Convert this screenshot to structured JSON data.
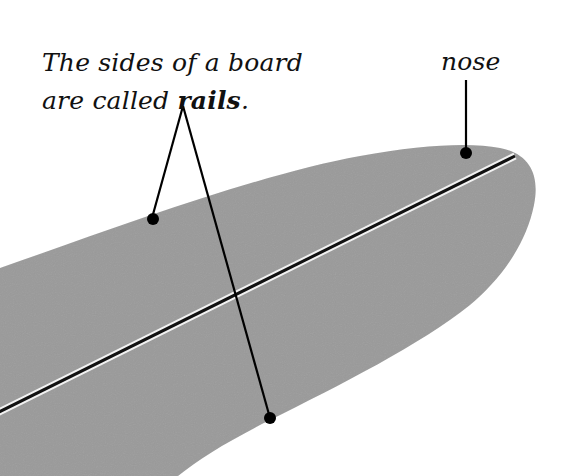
{
  "diagram": {
    "colors": {
      "board_fill": "#9a9a9a",
      "stringer_dark": "#111111",
      "stringer_light": "#f2f2f2",
      "leader": "#000000",
      "background": "#ffffff"
    },
    "labels": {
      "rails_line1": "The sides of a board",
      "rails_line2_prefix": "are called ",
      "rails_line2_bold": "rails",
      "rails_line2_suffix": ".",
      "nose": "nose"
    },
    "callouts": [
      {
        "target": "rails",
        "points": [
          [
            152,
            218
          ],
          [
            270,
            418
          ]
        ]
      },
      {
        "target": "nose",
        "points": [
          [
            466,
            152
          ]
        ]
      }
    ]
  }
}
